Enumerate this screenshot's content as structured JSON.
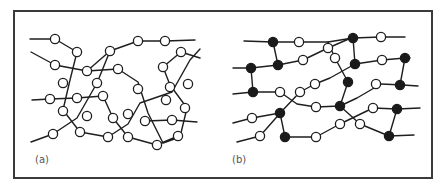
{
  "figure": {
    "panels": [
      {
        "id": "a",
        "label": "(a)",
        "label_pos": [
          35,
          163
        ],
        "description": "Entangled linear polymer chains (all open monomer nodes)",
        "chains": [
          [
            [
              30,
              39
            ],
            [
              55,
              39
            ],
            [
              77,
              52
            ],
            [
              70,
              80
            ],
            [
              63,
              110
            ],
            [
              80,
              132
            ],
            [
              108,
              137
            ],
            [
              128,
              124
            ],
            [
              140,
              103
            ],
            [
              172,
              92
            ],
            [
              190,
              60
            ],
            [
              200,
              49
            ]
          ],
          [
            [
              31,
              52
            ],
            [
              55,
              65
            ],
            [
              87,
              71
            ],
            [
              118,
              69
            ],
            [
              138,
              82
            ],
            [
              148,
              113
            ],
            [
              163,
              143
            ],
            [
              180,
              137
            ],
            [
              187,
              108
            ],
            [
              170,
              85
            ],
            [
              163,
              67
            ],
            [
              181,
              52
            ],
            [
              200,
              58
            ]
          ],
          [
            [
              32,
              100
            ],
            [
              50,
              99
            ],
            [
              77,
              98
            ],
            [
              103,
              96
            ],
            [
              113,
              118
            ],
            [
              128,
              137
            ],
            [
              157,
              145
            ],
            [
              178,
              136
            ]
          ],
          [
            [
              31,
              142
            ],
            [
              53,
              134
            ],
            [
              77,
              118
            ],
            [
              97,
              83
            ],
            [
              110,
              51
            ],
            [
              138,
              41
            ],
            [
              165,
              41
            ],
            [
              195,
              40
            ]
          ],
          [
            [
              146,
              121
            ],
            [
              172,
              120
            ],
            [
              197,
              122
            ]
          ],
          [
            [
              87,
              71
            ],
            [
              110,
              51
            ]
          ]
        ],
        "open_nodes": [
          [
            55,
            39
          ],
          [
            77,
            52
          ],
          [
            55,
            65
          ],
          [
            87,
            71
          ],
          [
            110,
            51
          ],
          [
            138,
            41
          ],
          [
            165,
            41
          ],
          [
            181,
            52
          ],
          [
            163,
            67
          ],
          [
            118,
            69
          ],
          [
            63,
            83
          ],
          [
            97,
            83
          ],
          [
            50,
            99
          ],
          [
            77,
            98
          ],
          [
            103,
            96
          ],
          [
            170,
            87
          ],
          [
            188,
            84
          ],
          [
            138,
            89
          ],
          [
            63,
            111
          ],
          [
            87,
            116
          ],
          [
            113,
            118
          ],
          [
            128,
            114
          ],
          [
            166,
            100
          ],
          [
            185,
            108
          ],
          [
            145,
            121
          ],
          [
            172,
            120
          ],
          [
            53,
            134
          ],
          [
            80,
            132
          ],
          [
            108,
            137
          ],
          [
            128,
            137
          ],
          [
            157,
            145
          ],
          [
            178,
            136
          ]
        ],
        "filled_nodes": []
      },
      {
        "id": "b",
        "label": "(b)",
        "label_pos": [
          232,
          163
        ],
        "description": "Crosslinked network (filled nodes mark crosslink points)",
        "chains": [
          [
            [
              244,
              41
            ],
            [
              273,
              42
            ],
            [
              299,
              42
            ],
            [
              328,
              42
            ],
            [
              353,
              38
            ],
            [
              381,
              37
            ],
            [
              405,
              37
            ]
          ],
          [
            [
              233,
              68
            ],
            [
              251,
              68
            ],
            [
              278,
              65
            ],
            [
              303,
              60
            ],
            [
              328,
              48
            ],
            [
              351,
              38
            ]
          ],
          [
            [
              251,
              68
            ],
            [
              253,
              92
            ]
          ],
          [
            [
              273,
              42
            ],
            [
              278,
              65
            ]
          ],
          [
            [
              353,
              38
            ],
            [
              355,
              64
            ]
          ],
          [
            [
              355,
              64
            ],
            [
              382,
              60
            ],
            [
              405,
              58
            ],
            [
              410,
              58
            ]
          ],
          [
            [
              405,
              58
            ],
            [
              400,
              85
            ]
          ],
          [
            [
              233,
              94
            ],
            [
              253,
              92
            ],
            [
              280,
              92
            ],
            [
              297,
              104
            ],
            [
              316,
              107
            ],
            [
              340,
              106
            ],
            [
              357,
              98
            ],
            [
              381,
              84
            ],
            [
              403,
              85
            ],
            [
              418,
              86
            ]
          ],
          [
            [
              355,
              64
            ],
            [
              330,
              78
            ],
            [
              315,
              84
            ],
            [
              300,
              92
            ],
            [
              282,
              111
            ],
            [
              260,
              136
            ],
            [
              237,
              142
            ]
          ],
          [
            [
              348,
              82
            ],
            [
              340,
              106
            ]
          ],
          [
            [
              328,
              42
            ],
            [
              335,
              58
            ],
            [
              348,
              82
            ]
          ],
          [
            [
              233,
              123
            ],
            [
              252,
              118
            ],
            [
              280,
              113
            ]
          ],
          [
            [
              280,
              113
            ],
            [
              285,
              137
            ],
            [
              316,
              137
            ],
            [
              340,
              124
            ],
            [
              373,
              108
            ],
            [
              397,
              109
            ],
            [
              420,
              108
            ]
          ],
          [
            [
              397,
              109
            ],
            [
              389,
              136
            ]
          ],
          [
            [
              340,
              106
            ],
            [
              360,
              124
            ],
            [
              389,
              136
            ],
            [
              414,
              135
            ]
          ]
        ],
        "open_nodes": [
          [
            299,
            42
          ],
          [
            381,
            37
          ],
          [
            303,
            60
          ],
          [
            328,
            48
          ],
          [
            382,
            60
          ],
          [
            335,
            58
          ],
          [
            315,
            84
          ],
          [
            300,
            92
          ],
          [
            280,
            92
          ],
          [
            316,
            107
          ],
          [
            376,
            84
          ],
          [
            373,
            108
          ],
          [
            252,
            118
          ],
          [
            316,
            137
          ],
          [
            340,
            124
          ],
          [
            360,
            124
          ],
          [
            260,
            136
          ]
        ],
        "filled_nodes": [
          [
            273,
            42
          ],
          [
            353,
            38
          ],
          [
            251,
            68
          ],
          [
            278,
            65
          ],
          [
            355,
            64
          ],
          [
            405,
            58
          ],
          [
            253,
            92
          ],
          [
            348,
            82
          ],
          [
            400,
            85
          ],
          [
            340,
            106
          ],
          [
            397,
            109
          ],
          [
            280,
            113
          ],
          [
            285,
            137
          ],
          [
            389,
            136
          ]
        ]
      }
    ],
    "frame": {
      "x": 14,
      "y": 11,
      "width": 418,
      "height": 167
    },
    "node_radius": 4.6,
    "colors": {
      "line": "#1e1e1e",
      "frame": "#3a3a3a",
      "open_fill": "#ffffff",
      "filled": "#1a1a1a",
      "label": "#555555",
      "background": "#ffffff"
    }
  }
}
